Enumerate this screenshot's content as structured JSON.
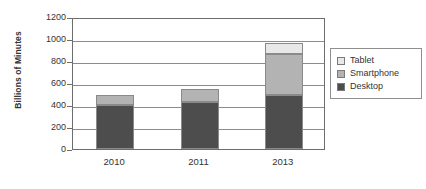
{
  "chart_data": {
    "type": "bar",
    "subtype": "stacked-column",
    "title": "",
    "xlabel": "",
    "ylabel": "Billions of Minutes",
    "categories": [
      "2010",
      "2011",
      "2013"
    ],
    "series": [
      {
        "name": "Desktop",
        "color": "#4d4d4d",
        "values": [
          400,
          425,
          490
        ]
      },
      {
        "name": "Smartphone",
        "color": "#b3b3b3",
        "values": [
          90,
          120,
          375
        ]
      },
      {
        "name": "Tablet",
        "color": "#e8e8e8",
        "values": [
          0,
          0,
          95
        ]
      }
    ],
    "totals": [
      490,
      545,
      960
    ],
    "ylim": [
      0,
      1200
    ],
    "ytick_labels": [
      "0",
      "200",
      "400",
      "600",
      "800",
      "1000",
      "1200"
    ],
    "ytick_values": [
      0,
      200,
      400,
      600,
      800,
      1000,
      1200
    ],
    "grid": true,
    "legend_position": "right",
    "legend_order": [
      "Tablet",
      "Smartphone",
      "Desktop"
    ]
  },
  "legend": {
    "entries": [
      {
        "label": "Tablet",
        "color": "#e8e8e8"
      },
      {
        "label": "Smartphone",
        "color": "#b3b3b3"
      },
      {
        "label": "Desktop",
        "color": "#4d4d4d"
      }
    ]
  },
  "axes": {
    "y_title": "Billions of Minutes"
  }
}
